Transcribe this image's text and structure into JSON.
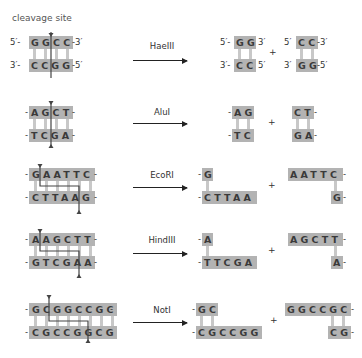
{
  "labels": {
    "cleavage_site": "cleavage site",
    "plus": "+"
  },
  "rows": [
    {
      "enzyme": "HaeIII",
      "top": "GGCC",
      "bottom": "CCGG",
      "top_prefix": "5′-",
      "top_suffix": "-3′",
      "bottom_prefix": "3′-",
      "bottom_suffix": "-5′",
      "frag1": {
        "top": "GG",
        "bottom": "CC",
        "top_prefix": "5′-",
        "top_suffix": "3′",
        "bottom_prefix": "3′-",
        "bottom_suffix": "5′"
      },
      "frag2": {
        "top": "CC",
        "bottom": "GG",
        "top_prefix": "5′",
        "top_suffix": "-3′",
        "bottom_prefix": "3′",
        "bottom_suffix": "-5′"
      }
    },
    {
      "enzyme": "AluI",
      "top": "AGCT",
      "bottom": "TCGA",
      "frag1": {
        "top": "AG",
        "bottom": "TC"
      },
      "frag2": {
        "top": "CT",
        "bottom": "GA"
      }
    },
    {
      "enzyme": "EcoRI",
      "top": "GAATTC",
      "bottom": "CTTAAG",
      "frag1": {
        "top": "G",
        "bottom": "CTTAA"
      },
      "frag2": {
        "top": "AATTC",
        "bottom": "G"
      }
    },
    {
      "enzyme": "HindIII",
      "top": "AAGCTT",
      "bottom": "GTCGAA",
      "frag1": {
        "top": "A",
        "bottom": "TTCGA"
      },
      "frag2": {
        "top": "AGCTT",
        "bottom": "A"
      }
    },
    {
      "enzyme": "NotI",
      "top": "GCGGCCGC",
      "bottom": "CGCCGGCG",
      "frag1": {
        "top": "GC",
        "bottom": "CGCCGG"
      },
      "frag2": {
        "top": "GGCCGC",
        "bottom": "CG"
      }
    }
  ],
  "colors": {
    "strand_box": "#b3b3b3",
    "rung": "#c8c8c8",
    "cut_line": "#444444"
  }
}
